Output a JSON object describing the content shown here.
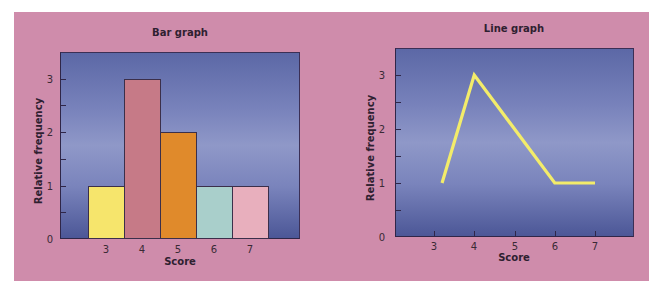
{
  "page": {
    "background_panel_color": "#cf8cab",
    "plot_bg_color": "#7882bb"
  },
  "chart_data": [
    {
      "type": "bar",
      "title": "Bar graph",
      "xlabel": "Score",
      "ylabel": "Relative frequency",
      "categories": [
        "3",
        "4",
        "5",
        "6",
        "7"
      ],
      "values": [
        1,
        3,
        2,
        1,
        1
      ],
      "bar_colors": [
        "#f6e56c",
        "#c67a87",
        "#e08a2b",
        "#a9cfcb",
        "#e8afbd"
      ],
      "yticks": [
        "0",
        "1",
        "2",
        "3"
      ],
      "ylim": [
        0,
        3.5
      ],
      "grid": false,
      "legend": null
    },
    {
      "type": "line",
      "title": "Line graph",
      "xlabel": "Score",
      "ylabel": "Relative frequency",
      "x": [
        3,
        4,
        5,
        6,
        7
      ],
      "categories": [
        "3",
        "4",
        "5",
        "6",
        "7"
      ],
      "values": [
        1,
        3,
        2,
        1,
        1
      ],
      "line_points": [
        [
          3.2,
          1
        ],
        [
          4,
          3
        ],
        [
          6,
          1
        ],
        [
          7,
          1
        ]
      ],
      "line_color": "#f3ec6a",
      "yticks": [
        "0",
        "1",
        "2",
        "3"
      ],
      "ylim": [
        0,
        3.5
      ],
      "grid": false,
      "legend": null
    }
  ]
}
